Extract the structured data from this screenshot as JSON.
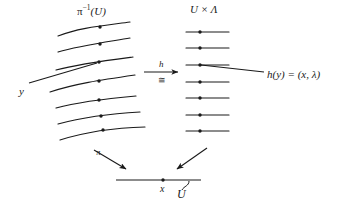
{
  "figure": {
    "kind": "fiber-bundle-local-trivialization-diagram",
    "background_color": "#ffffff",
    "ink_color": "#1a1a1a"
  },
  "labels": {
    "preimage_base": "π",
    "preimage_sup": "−1",
    "preimage_arg": "(U)",
    "product_space": "U × Λ",
    "point_y": "y",
    "map_h": "h",
    "map_iso": "≅",
    "image_equation": "h(y) = (x, λ)",
    "projection_pi": "π",
    "base_point_x": "x",
    "base_open_set": "U"
  },
  "left_fibers": {
    "description": "seven curved fibers over U sweeping left-to-right, each carrying a marked point",
    "count": 7,
    "marked_point_count": 7,
    "paths": [
      "M 58,36 C 78,28 100,26 130,22",
      "M 58,52 C 78,46 100,43 130,38",
      "M 56,70 C 78,64 102,61 133,57",
      "M 50,92 C 74,84 100,80 135,75",
      "M 56,108 C 78,102 102,99 136,96",
      "M 58,124 C 80,118 104,114 140,112",
      "M 60,140 C 82,133 106,128 145,127"
    ],
    "dots": [
      {
        "x": 100,
        "y": 27
      },
      {
        "x": 100,
        "y": 44
      },
      {
        "x": 99,
        "y": 62
      },
      {
        "x": 99,
        "y": 81
      },
      {
        "x": 99,
        "y": 100
      },
      {
        "x": 101,
        "y": 116
      },
      {
        "x": 103,
        "y": 130
      }
    ]
  },
  "right_fibers": {
    "description": "seven straight horizontal fibers of the trivialized bundle U × Λ, each carrying a marked point",
    "count": 7,
    "x_start": 186,
    "x_end": 229,
    "dot_x": 200,
    "rows_y": [
      32,
      48,
      65,
      82,
      98,
      115,
      131
    ]
  },
  "connectors": {
    "y_pointer": {
      "from_x": 29,
      "from_y": 83,
      "to_x": 97,
      "to_y": 63,
      "note": "leader line from the label y to its point in the fiber"
    },
    "h_arrow": {
      "from_x": 144,
      "from_y": 72,
      "to_x": 180,
      "to_y": 72,
      "note": "horizontal arrow labeled h with iso symbol beneath"
    },
    "hy_pointer": {
      "from_x": 264,
      "from_y": 72,
      "to_x": 200,
      "to_y": 65,
      "note": "leader line from the equation h(y) = (x, lambda) to the image point"
    },
    "pi_arrow": {
      "from_x": 94,
      "from_y": 150,
      "to_x": 128,
      "to_y": 170,
      "note": "projection arrow pi pointing down-right to the base"
    },
    "second_arrow": {
      "from_x": 207,
      "from_y": 148,
      "to_x": 175,
      "to_y": 170,
      "note": "projection arrow from the product space down-left to the base"
    }
  },
  "base": {
    "line_from_x": 116,
    "line_to_x": 201,
    "line_y": 180,
    "dot_x": 163,
    "dot_y": 180,
    "brace_note": "small hook/brace under the base line marking the open set U"
  }
}
